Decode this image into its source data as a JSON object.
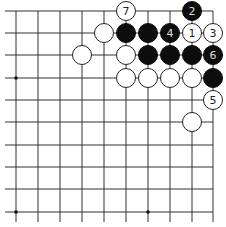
{
  "board": {
    "cols": 10,
    "rows": 10,
    "x_positions": [
      16,
      38,
      60,
      82,
      104,
      126,
      148,
      170,
      192,
      213
    ],
    "y_positions": [
      11,
      33,
      55,
      78,
      100,
      122,
      145,
      167,
      189,
      212
    ],
    "edges": {
      "top": true,
      "right": true,
      "left": false,
      "bottom": false
    },
    "line_color": "#333333",
    "star_points": [
      [
        0,
        3
      ],
      [
        0,
        9
      ],
      [
        6,
        9
      ]
    ]
  },
  "stones": [
    {
      "col": 5,
      "row": 0,
      "color": "white",
      "label": "7"
    },
    {
      "col": 8,
      "row": 0,
      "color": "black",
      "label": "2"
    },
    {
      "col": 4,
      "row": 1,
      "color": "white",
      "label": ""
    },
    {
      "col": 5,
      "row": 1,
      "color": "black",
      "label": ""
    },
    {
      "col": 6,
      "row": 1,
      "color": "black",
      "label": ""
    },
    {
      "col": 7,
      "row": 1,
      "color": "black",
      "label": "4"
    },
    {
      "col": 8,
      "row": 1,
      "color": "white",
      "label": "1"
    },
    {
      "col": 9,
      "row": 1,
      "color": "white",
      "label": "3"
    },
    {
      "col": 3,
      "row": 2,
      "color": "white",
      "label": ""
    },
    {
      "col": 5,
      "row": 2,
      "color": "white",
      "label": ""
    },
    {
      "col": 6,
      "row": 2,
      "color": "black",
      "label": ""
    },
    {
      "col": 7,
      "row": 2,
      "color": "black",
      "label": ""
    },
    {
      "col": 8,
      "row": 2,
      "color": "black",
      "label": ""
    },
    {
      "col": 9,
      "row": 2,
      "color": "black",
      "label": "6"
    },
    {
      "col": 5,
      "row": 3,
      "color": "white",
      "label": ""
    },
    {
      "col": 6,
      "row": 3,
      "color": "white",
      "label": ""
    },
    {
      "col": 7,
      "row": 3,
      "color": "white",
      "label": ""
    },
    {
      "col": 8,
      "row": 3,
      "color": "white",
      "label": ""
    },
    {
      "col": 9,
      "row": 3,
      "color": "black",
      "label": ""
    },
    {
      "col": 9,
      "row": 4,
      "color": "white",
      "label": "5"
    },
    {
      "col": 8,
      "row": 5,
      "color": "white",
      "label": ""
    }
  ]
}
